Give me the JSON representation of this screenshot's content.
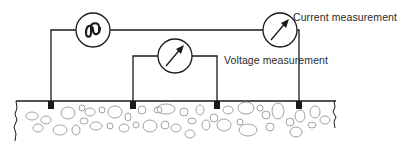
{
  "diagram": {
    "type": "resistivity-measurement-circuit",
    "labels": {
      "current": "Current measurement",
      "voltage": "Voltage measurement"
    },
    "components": [
      {
        "id": "ac-source",
        "symbol": "sine-wave"
      },
      {
        "id": "current-meter",
        "symbol": "meter-arrow"
      },
      {
        "id": "voltage-meter",
        "symbol": "meter-arrow"
      }
    ],
    "electrodes": 4,
    "colors": {
      "line": "#1a1a1a",
      "soil": "#8a8a8a",
      "text": "#2a2a2a"
    }
  }
}
